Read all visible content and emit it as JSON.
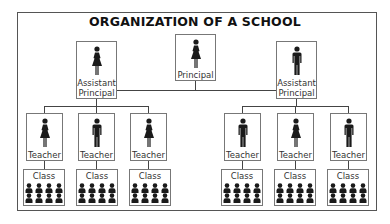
{
  "title": "ORGANIZATION OF A SCHOOL",
  "principal": {
    "label": "Principal",
    "icon": "female-figure-icon"
  },
  "assistant_principals": [
    {
      "label_line1": "Assistant",
      "label_line2": "Principal",
      "icon": "female-figure-icon"
    },
    {
      "label_line1": "Assistant",
      "label_line2": "Principal",
      "icon": "male-figure-icon"
    }
  ],
  "teachers": [
    {
      "label": "Teacher",
      "icon": "female-figure-icon"
    },
    {
      "label": "Teacher",
      "icon": "male-figure-icon"
    },
    {
      "label": "Teacher",
      "icon": "female-figure-icon"
    },
    {
      "label": "Teacher",
      "icon": "male-figure-icon"
    },
    {
      "label": "Teacher",
      "icon": "female-figure-icon"
    },
    {
      "label": "Teacher",
      "icon": "male-figure-icon"
    }
  ],
  "classes": [
    {
      "label": "Class",
      "students": 8
    },
    {
      "label": "Class",
      "students": 8
    },
    {
      "label": "Class",
      "students": 8
    },
    {
      "label": "Class",
      "students": 8
    },
    {
      "label": "Class",
      "students": 8
    },
    {
      "label": "Class",
      "students": 8
    }
  ],
  "colors": {
    "line": "#444444",
    "border": "#777777",
    "figure": "#1a1a1a"
  }
}
